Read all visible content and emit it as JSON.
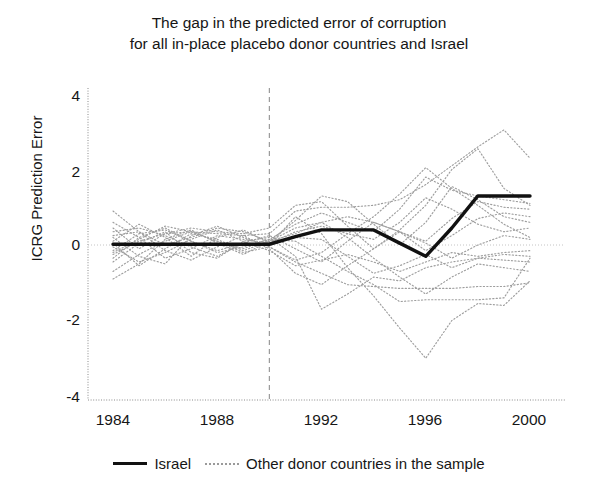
{
  "chart_data": {
    "type": "line",
    "title": "The gap in the predicted error of corruption for all in-place placebo donor countries and Israel",
    "title_lines": [
      "The gap in the predicted error of corruption",
      "for all in-place placebo donor countries and Israel"
    ],
    "xlabel": "",
    "ylabel": "ICRG Prediction Error",
    "xlim": [
      1984,
      2001
    ],
    "ylim": [
      -4,
      4
    ],
    "xticks": [
      1984,
      1988,
      1992,
      1996,
      2000
    ],
    "yticks": [
      -4,
      -2,
      0,
      2,
      4
    ],
    "grid": false,
    "legend_position": "bottom",
    "annotations": [
      {
        "name": "treatment-year-line",
        "type": "vline",
        "x": 1990,
        "style": "dashed",
        "color": "#9a9a9a"
      },
      {
        "name": "zero-reference-line",
        "type": "hline",
        "y": 0,
        "style": "dotted",
        "color": "#c4c4c4"
      }
    ],
    "colors": {
      "israel": "#111111",
      "placebo": "#9e9e9e",
      "axis": "#8a8a8a",
      "text": "#161616"
    },
    "x": [
      1984,
      1985,
      1986,
      1987,
      1988,
      1989,
      1990,
      1991,
      1992,
      1993,
      1994,
      1995,
      1996,
      1997,
      1998,
      1999,
      2000
    ],
    "series": [
      {
        "name": "Israel",
        "style": "solid",
        "width": 3.4,
        "color": "#111111",
        "values": [
          0.02,
          0.02,
          0.02,
          0.02,
          0.02,
          0.02,
          0.02,
          0.22,
          0.4,
          0.4,
          0.4,
          0.05,
          -0.3,
          0.45,
          1.3,
          1.3,
          1.3
        ]
      },
      {
        "name": "placebo-1",
        "style": "dotted",
        "color": "#9e9e9e",
        "values": [
          0.45,
          -0.1,
          0.3,
          0.35,
          0.3,
          0.25,
          0.3,
          0.9,
          1.0,
          1.0,
          1.05,
          1.2,
          1.6,
          2.1,
          2.6,
          3.05,
          2.3
        ]
      },
      {
        "name": "placebo-2",
        "style": "dotted",
        "color": "#9e9e9e",
        "values": [
          -0.2,
          0.15,
          0.5,
          0.35,
          0.1,
          -0.1,
          0.15,
          0.55,
          0.85,
          0.6,
          0.35,
          0.95,
          1.8,
          1.45,
          1.3,
          1.2,
          1.1
        ]
      },
      {
        "name": "placebo-3",
        "style": "dotted",
        "color": "#9e9e9e",
        "values": [
          0.9,
          0.35,
          0.0,
          0.2,
          0.45,
          0.35,
          0.1,
          0.45,
          0.6,
          0.75,
          0.6,
          0.35,
          0.1,
          0.7,
          1.15,
          1.0,
          0.95
        ]
      },
      {
        "name": "placebo-4",
        "style": "dotted",
        "color": "#9e9e9e",
        "values": [
          -0.35,
          0.2,
          0.45,
          0.1,
          -0.15,
          0.05,
          0.25,
          -0.1,
          -0.45,
          0.1,
          0.6,
          0.35,
          -0.15,
          0.25,
          0.7,
          0.85,
          0.75
        ]
      },
      {
        "name": "placebo-5",
        "style": "dotted",
        "color": "#9e9e9e",
        "values": [
          0.1,
          0.55,
          0.2,
          -0.3,
          0.2,
          0.4,
          0.05,
          0.35,
          0.5,
          0.3,
          0.15,
          0.6,
          1.25,
          0.95,
          0.55,
          0.35,
          0.45
        ]
      },
      {
        "name": "placebo-6",
        "style": "dotted",
        "color": "#9e9e9e",
        "values": [
          -0.7,
          -0.25,
          0.1,
          0.35,
          0.1,
          -0.2,
          -0.05,
          -0.4,
          -0.2,
          0.3,
          0.75,
          1.35,
          2.05,
          1.5,
          1.05,
          0.55,
          0.2
        ]
      },
      {
        "name": "placebo-7",
        "style": "dotted",
        "color": "#9e9e9e",
        "values": [
          0.25,
          0.35,
          -0.15,
          -0.4,
          -0.05,
          0.25,
          -0.1,
          -0.75,
          -1.05,
          -0.55,
          -0.1,
          0.35,
          0.05,
          -0.35,
          0.0,
          0.25,
          0.15
        ]
      },
      {
        "name": "placebo-8",
        "style": "dotted",
        "color": "#9e9e9e",
        "values": [
          -0.05,
          -0.45,
          -0.2,
          0.15,
          0.4,
          0.1,
          -0.15,
          -0.55,
          -0.4,
          -0.25,
          -0.45,
          -0.7,
          -0.45,
          -0.2,
          -0.3,
          -0.2,
          -0.15
        ]
      },
      {
        "name": "placebo-9",
        "style": "dotted",
        "color": "#9e9e9e",
        "values": [
          0.6,
          0.2,
          -0.35,
          -0.1,
          0.25,
          0.15,
          0.05,
          0.2,
          0.15,
          -0.3,
          -0.75,
          -0.55,
          -0.25,
          -0.6,
          -0.35,
          -0.25,
          -0.3
        ]
      },
      {
        "name": "placebo-10",
        "style": "dotted",
        "color": "#9e9e9e",
        "values": [
          -0.45,
          0.05,
          0.35,
          -0.2,
          -0.35,
          0.1,
          0.2,
          -0.3,
          -1.7,
          -1.3,
          -0.85,
          -0.95,
          -0.6,
          -0.45,
          -0.35,
          -0.4,
          -0.45
        ]
      },
      {
        "name": "placebo-11",
        "style": "dotted",
        "color": "#9e9e9e",
        "values": [
          0.2,
          -0.3,
          -0.5,
          0.25,
          0.5,
          0.2,
          -0.05,
          -0.45,
          -0.75,
          -1.05,
          -1.1,
          -1.15,
          -1.15,
          -1.15,
          -1.1,
          -1.1,
          -1.0
        ]
      },
      {
        "name": "placebo-12",
        "style": "dotted",
        "color": "#9e9e9e",
        "values": [
          -0.9,
          -0.5,
          0.15,
          0.4,
          0.05,
          -0.25,
          0.1,
          0.3,
          0.6,
          0.2,
          -0.35,
          -0.85,
          -1.3,
          -0.85,
          -0.5,
          -0.6,
          -0.7
        ]
      },
      {
        "name": "placebo-13",
        "style": "dotted",
        "color": "#9e9e9e",
        "values": [
          0.35,
          0.45,
          0.25,
          -0.05,
          -0.3,
          0.05,
          0.0,
          0.75,
          0.3,
          -0.6,
          -1.35,
          -2.2,
          -3.0,
          -2.0,
          -1.55,
          -1.6,
          -0.95
        ]
      },
      {
        "name": "placebo-14",
        "style": "dotted",
        "color": "#9e9e9e",
        "values": [
          -0.15,
          0.3,
          0.4,
          0.1,
          -0.2,
          -0.05,
          0.15,
          0.1,
          -0.3,
          -0.7,
          -1.05,
          -1.5,
          -1.45,
          -1.45,
          -1.45,
          -1.4,
          -0.35
        ]
      },
      {
        "name": "placebo-15",
        "style": "dotted",
        "color": "#9e9e9e",
        "values": [
          0.05,
          -0.55,
          -0.1,
          0.3,
          0.15,
          -0.15,
          0.1,
          0.65,
          1.3,
          1.15,
          0.55,
          0.0,
          0.6,
          1.55,
          1.2,
          0.75,
          0.6
        ]
      },
      {
        "name": "placebo-16",
        "style": "dotted",
        "color": "#9e9e9e",
        "values": [
          -0.25,
          0.1,
          0.3,
          0.45,
          0.35,
          0.3,
          0.45,
          1.05,
          1.15,
          0.5,
          -0.1,
          0.4,
          1.05,
          2.0,
          2.55,
          1.5,
          1.05
        ]
      }
    ]
  },
  "legend": {
    "items": [
      {
        "label": "Israel",
        "style": "solid"
      },
      {
        "label": "Other donor countries in the sample",
        "style": "dotted"
      }
    ]
  },
  "axes": {
    "y_tick_labels": [
      "4",
      "2",
      "0",
      "-2",
      "-4"
    ],
    "x_tick_labels": [
      "1984",
      "1988",
      "1992",
      "1996",
      "2000"
    ]
  }
}
